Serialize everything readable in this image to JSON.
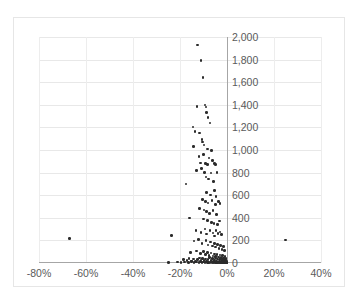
{
  "chart_data": {
    "type": "scatter",
    "title": "",
    "subtitle": "",
    "xlabel": "",
    "ylabel": "",
    "xlim": [
      -80,
      40
    ],
    "ylim": [
      0,
      2000
    ],
    "xticks": [
      -80,
      -60,
      -40,
      -20,
      0,
      20,
      40
    ],
    "xtick_labels": [
      "-80%",
      "-60%",
      "-40%",
      "-20%",
      "0%",
      "20%",
      "40%"
    ],
    "yticks": [
      0,
      200,
      400,
      600,
      800,
      1000,
      1200,
      1400,
      1600,
      1800,
      2000
    ],
    "ytick_labels": [
      "0",
      "200",
      "400",
      "600",
      "800",
      "1,000",
      "1,200",
      "1,400",
      "1,600",
      "1,800",
      "2,000"
    ],
    "grid": true,
    "legend": false,
    "legend_position": "none",
    "marker_color": "#2b2b2b",
    "gridline_color": "#e8e8e8",
    "axis_color": "#a6a6a6",
    "tick_label_color": "#5a5a5a",
    "y_axis_label_side": "right-of-zero-line",
    "series": [
      {
        "name": "series-1",
        "points": [
          [
            -12.5,
            1930
          ],
          [
            -11.0,
            1790
          ],
          [
            -10.2,
            1640
          ],
          [
            -12.8,
            1385
          ],
          [
            -9.4,
            1400
          ],
          [
            -9.0,
            1380
          ],
          [
            -8.6,
            1330
          ],
          [
            -8.0,
            1285
          ],
          [
            -7.2,
            1240
          ],
          [
            -14.5,
            1205
          ],
          [
            -13.6,
            1165
          ],
          [
            -11.8,
            1150
          ],
          [
            -10.6,
            1095
          ],
          [
            -10.4,
            1070
          ],
          [
            -14.2,
            1030
          ],
          [
            -9.8,
            1045
          ],
          [
            -8.2,
            1010
          ],
          [
            -6.6,
            995
          ],
          [
            -10.0,
            960
          ],
          [
            -12.0,
            940
          ],
          [
            -7.6,
            930
          ],
          [
            -6.2,
            905
          ],
          [
            -11.2,
            885
          ],
          [
            -9.2,
            880
          ],
          [
            -8.4,
            872
          ],
          [
            -5.4,
            878
          ],
          [
            -4.8,
            870
          ],
          [
            -13.0,
            820
          ],
          [
            -10.8,
            835
          ],
          [
            -9.6,
            800
          ],
          [
            -6.8,
            795
          ],
          [
            -4.2,
            800
          ],
          [
            -17.5,
            700
          ],
          [
            -9.0,
            760
          ],
          [
            -7.8,
            745
          ],
          [
            -5.8,
            720
          ],
          [
            -8.8,
            625
          ],
          [
            -7.0,
            600
          ],
          [
            -5.2,
            640
          ],
          [
            -4.6,
            590
          ],
          [
            -10.4,
            560
          ],
          [
            -9.2,
            545
          ],
          [
            -8.0,
            530
          ],
          [
            -6.4,
            555
          ],
          [
            -5.0,
            520
          ],
          [
            -3.6,
            545
          ],
          [
            -3.0,
            525
          ],
          [
            -11.6,
            480
          ],
          [
            -9.8,
            470
          ],
          [
            -8.6,
            455
          ],
          [
            -7.4,
            440
          ],
          [
            -6.0,
            465
          ],
          [
            -4.4,
            430
          ],
          [
            -16.0,
            400
          ],
          [
            -10.0,
            390
          ],
          [
            -8.2,
            375
          ],
          [
            -6.6,
            360
          ],
          [
            -5.6,
            350
          ],
          [
            -4.0,
            340
          ],
          [
            -3.2,
            370
          ],
          [
            -13.2,
            290
          ],
          [
            -11.0,
            270
          ],
          [
            -9.4,
            300
          ],
          [
            -8.8,
            255
          ],
          [
            -7.2,
            285
          ],
          [
            -6.0,
            265
          ],
          [
            -5.2,
            240
          ],
          [
            -4.6,
            290
          ],
          [
            -3.8,
            260
          ],
          [
            -3.0,
            275
          ],
          [
            -2.4,
            250
          ],
          [
            -23.5,
            245
          ],
          [
            -67.0,
            215
          ],
          [
            25.0,
            205
          ],
          [
            -14.0,
            195
          ],
          [
            -12.2,
            210
          ],
          [
            -10.6,
            175
          ],
          [
            -9.0,
            200
          ],
          [
            -8.0,
            160
          ],
          [
            -7.0,
            185
          ],
          [
            -6.2,
            150
          ],
          [
            -5.4,
            170
          ],
          [
            -4.8,
            140
          ],
          [
            -4.0,
            165
          ],
          [
            -3.4,
            130
          ],
          [
            -2.8,
            155
          ],
          [
            -2.2,
            120
          ],
          [
            -1.6,
            145
          ],
          [
            -1.0,
            110
          ],
          [
            -15.5,
            95
          ],
          [
            -13.0,
            105
          ],
          [
            -11.4,
            85
          ],
          [
            -10.0,
            100
          ],
          [
            -9.2,
            75
          ],
          [
            -8.4,
            92
          ],
          [
            -7.6,
            68
          ],
          [
            -6.8,
            88
          ],
          [
            -6.0,
            62
          ],
          [
            -5.4,
            80
          ],
          [
            -4.8,
            58
          ],
          [
            -4.2,
            76
          ],
          [
            -3.6,
            52
          ],
          [
            -3.0,
            70
          ],
          [
            -2.6,
            48
          ],
          [
            -2.0,
            66
          ],
          [
            -1.4,
            44
          ],
          [
            -0.8,
            60
          ],
          [
            -0.4,
            40
          ],
          [
            -18.5,
            30
          ],
          [
            -17.0,
            22
          ],
          [
            -16.2,
            38
          ],
          [
            -15.0,
            18
          ],
          [
            -14.2,
            34
          ],
          [
            -13.4,
            14
          ],
          [
            -12.6,
            30
          ],
          [
            -11.8,
            45
          ],
          [
            -11.0,
            26
          ],
          [
            -10.4,
            42
          ],
          [
            -9.8,
            20
          ],
          [
            -9.2,
            36
          ],
          [
            -8.6,
            16
          ],
          [
            -8.0,
            32
          ],
          [
            -7.4,
            48
          ],
          [
            -6.8,
            24
          ],
          [
            -6.2,
            40
          ],
          [
            -5.8,
            12
          ],
          [
            -5.2,
            28
          ],
          [
            -4.8,
            44
          ],
          [
            -4.4,
            18
          ],
          [
            -4.0,
            34
          ],
          [
            -3.6,
            10
          ],
          [
            -3.2,
            26
          ],
          [
            -2.8,
            42
          ],
          [
            -2.4,
            16
          ],
          [
            -2.0,
            32
          ],
          [
            -1.8,
            8
          ],
          [
            -1.6,
            24
          ],
          [
            -1.4,
            38
          ],
          [
            -1.2,
            14
          ],
          [
            -1.0,
            28
          ],
          [
            -0.8,
            6
          ],
          [
            -0.6,
            22
          ],
          [
            -0.4,
            34
          ],
          [
            -0.2,
            12
          ],
          [
            -25.0,
            5
          ],
          [
            -21.0,
            8
          ],
          [
            -19.5,
            4
          ],
          [
            -18.0,
            10
          ],
          [
            -16.5,
            6
          ],
          [
            -15.2,
            12
          ],
          [
            -14.0,
            4
          ],
          [
            -13.0,
            9
          ],
          [
            -12.0,
            5
          ],
          [
            -11.2,
            11
          ],
          [
            -10.6,
            3
          ],
          [
            -10.0,
            8
          ],
          [
            -9.4,
            5
          ],
          [
            -8.8,
            10
          ],
          [
            -8.2,
            3
          ],
          [
            -7.8,
            7
          ],
          [
            -7.2,
            4
          ],
          [
            -6.8,
            9
          ],
          [
            -6.4,
            2
          ],
          [
            -6.0,
            6
          ],
          [
            -5.6,
            4
          ],
          [
            -5.2,
            8
          ],
          [
            -4.8,
            2
          ],
          [
            -4.4,
            6
          ],
          [
            -4.0,
            3
          ],
          [
            -3.8,
            7
          ],
          [
            -3.4,
            2
          ],
          [
            -3.0,
            5
          ],
          [
            -2.8,
            3
          ],
          [
            -2.6,
            7
          ],
          [
            -2.4,
            2
          ],
          [
            -2.2,
            4
          ],
          [
            -2.0,
            6
          ],
          [
            -1.8,
            2
          ],
          [
            -1.6,
            5
          ],
          [
            -1.4,
            3
          ],
          [
            -1.2,
            7
          ],
          [
            -1.0,
            2
          ],
          [
            -0.9,
            4
          ],
          [
            -0.8,
            6
          ],
          [
            -0.7,
            2
          ],
          [
            -0.6,
            5
          ],
          [
            -0.5,
            3
          ],
          [
            -0.4,
            7
          ],
          [
            -0.3,
            2
          ],
          [
            -0.2,
            4
          ],
          [
            -0.15,
            6
          ],
          [
            -0.1,
            3
          ]
        ]
      }
    ]
  }
}
